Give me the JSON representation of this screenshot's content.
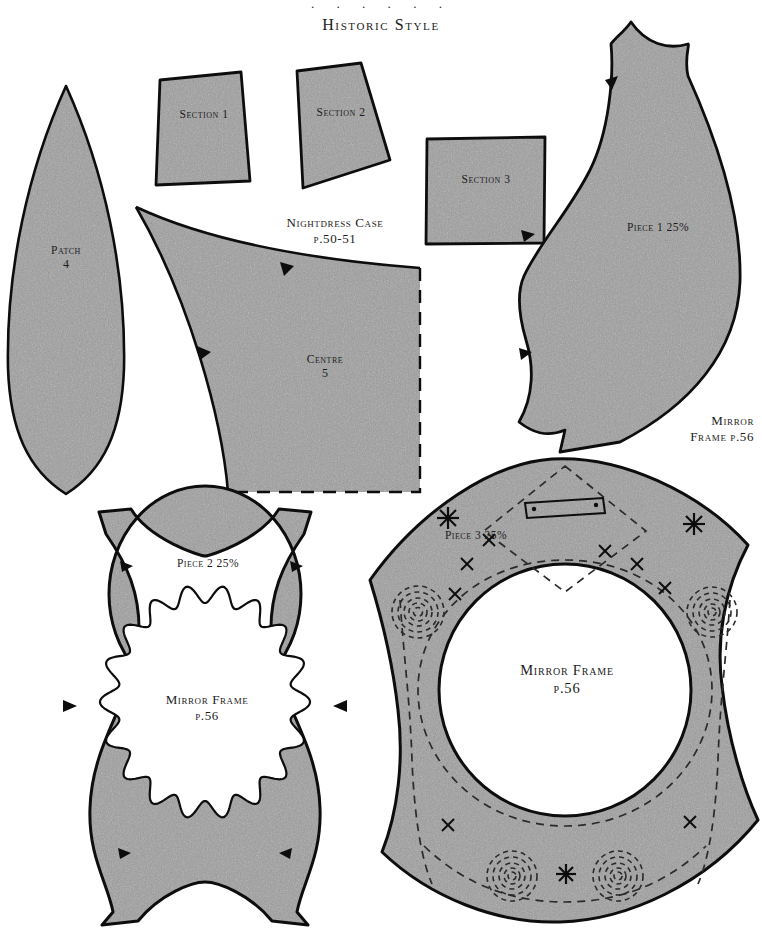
{
  "page": {
    "title": "Historic Style",
    "dots": "· · · · · ·",
    "width": 762,
    "height": 934,
    "background": "#ffffff",
    "ink": "#111111",
    "fabric_fill": "#c9c9c9",
    "fabric_fill_light": "#d4d4d4"
  },
  "pieces": {
    "patch": {
      "name": "Patch",
      "number": "4"
    },
    "section1": {
      "name": "Section 1"
    },
    "section2": {
      "name": "Section 2"
    },
    "section3": {
      "name": "Section 3"
    },
    "centre": {
      "name": "Centre",
      "number": "5"
    },
    "piece1": {
      "name": "Piece 1 25%"
    },
    "piece2": {
      "name": "Piece 2 25%"
    },
    "piece3": {
      "name": "Piece 3 25%"
    }
  },
  "captions": {
    "nightdress_case": {
      "line1": "Nightdress Case",
      "line2": "p.50-51"
    },
    "mirror_frame_right": {
      "line1": "Mirror",
      "line2": "Frame p.56"
    },
    "mirror_frame_piece2": {
      "line1": "Mirror Frame",
      "line2": "p.56"
    },
    "mirror_frame_piece3": {
      "line1": "Mirror Frame",
      "line2": "p.56"
    }
  },
  "markings": {
    "notch": "notch-triangle",
    "star": "asterisk-star",
    "cross": "cross-stitch-x",
    "spiral": "dashed-spiral",
    "slot": "hanging-slot-rectangle",
    "diamond": "dashed-diamond"
  }
}
